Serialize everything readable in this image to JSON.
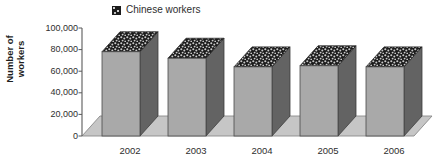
{
  "chart_data": {
    "type": "bar",
    "title": "",
    "subtitle": "",
    "xlabel": "",
    "ylabel": "Number of workers",
    "categories": [
      "2002",
      "2003",
      "2004",
      "2005",
      "2006"
    ],
    "series": [
      {
        "name": "Chinese workers",
        "values": [
          78000,
          72000,
          64000,
          65000,
          64000
        ]
      }
    ],
    "ylim": [
      0,
      100000
    ],
    "ytick_values": [
      0,
      20000,
      40000,
      60000,
      80000,
      100000
    ],
    "ytick_labels": [
      "0",
      "20,000",
      "40,000",
      "60,000",
      "80,000",
      "100,000"
    ],
    "grid": false,
    "legend_position": "top-center",
    "style": "3d-column",
    "colors": {
      "bar_front": "#a9a9a9",
      "bar_side": "#636363",
      "bar_top": "#1b1b1b",
      "floor": "#c6c6c6",
      "floor_edge": "#8a8a8a",
      "axis": "#5a5a5a",
      "text": "#2e2e2e"
    }
  },
  "legend": {
    "swatch_icon": "speckled-square-swatch",
    "label": "Chinese workers"
  },
  "y_axis": {
    "title": "Number of\nworkers"
  }
}
